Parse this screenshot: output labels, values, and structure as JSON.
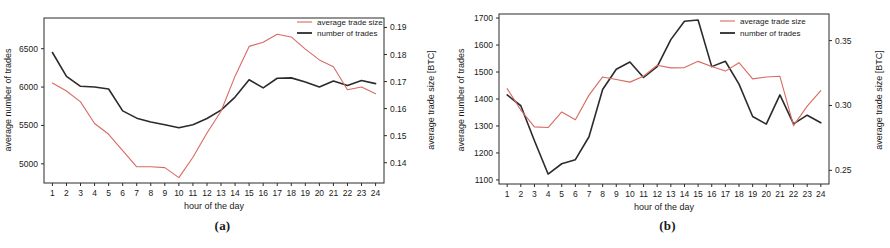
{
  "figure": {
    "panels": [
      {
        "caption": "(a)",
        "xlabel": "hour of the day",
        "ylabel_left": "average number of trades",
        "ylabel_right": "average trade size [BTC]",
        "legend": [
          {
            "label": "average trade size",
            "color": "#d96a62"
          },
          {
            "label": "number of trades",
            "color": "#2b2b2b"
          }
        ]
      },
      {
        "caption": "(b)",
        "xlabel": "hour of the day",
        "ylabel_left": "average number of trades",
        "ylabel_right": "average trade size [BTC]",
        "legend": [
          {
            "label": "average trade size",
            "color": "#d96a62"
          },
          {
            "label": "number of trades",
            "color": "#2b2b2b"
          }
        ]
      }
    ]
  },
  "chart_data": [
    {
      "type": "line",
      "panel": "(a)",
      "title": "",
      "xlabel": "hour of the day",
      "ylabel": "average number of trades",
      "ylabel_right": "average trade size [BTC]",
      "x": [
        1,
        2,
        3,
        4,
        5,
        6,
        7,
        8,
        9,
        10,
        11,
        12,
        13,
        14,
        15,
        16,
        17,
        18,
        19,
        20,
        21,
        22,
        23,
        24
      ],
      "xticklabels": [
        "1",
        "2",
        "3",
        "4",
        "5",
        "6",
        "7",
        "8",
        "9",
        "10",
        "11",
        "12",
        "13",
        "14",
        "15",
        "16",
        "17",
        "18",
        "19",
        "20",
        "21",
        "22",
        "23",
        "24"
      ],
      "xlim": [
        0.4,
        24.6
      ],
      "ylim_left": [
        4750,
        6900
      ],
      "yticks_left": [
        5000,
        5500,
        6000,
        6500
      ],
      "yticklabels_left": [
        "5000",
        "5500",
        "6000",
        "6500"
      ],
      "ylim_right": [
        0.1325,
        0.1935
      ],
      "yticks_right": [
        0.14,
        0.15,
        0.16,
        0.17,
        0.18,
        0.19
      ],
      "yticklabels_right": [
        "0.14",
        "0.15",
        "0.16",
        "0.17",
        "0.18",
        "0.19"
      ],
      "grid": false,
      "legend_position": "top-right",
      "series": [
        {
          "name": "number of trades",
          "color": "#2b2b2b",
          "axis": "left",
          "values": [
            6450,
            6140,
            6010,
            6000,
            5975,
            5690,
            5595,
            5545,
            5510,
            5470,
            5510,
            5590,
            5700,
            5870,
            6095,
            5990,
            6115,
            6120,
            6065,
            6000,
            6080,
            6020,
            6085,
            6045
          ]
        },
        {
          "name": "average trade size",
          "color": "#d96a62",
          "axis": "right",
          "values": [
            0.1695,
            0.1665,
            0.1625,
            0.1545,
            0.1505,
            0.1445,
            0.1385,
            0.1385,
            0.1382,
            0.1345,
            0.142,
            0.151,
            0.159,
            0.172,
            0.183,
            0.1845,
            0.1875,
            0.1865,
            0.182,
            0.178,
            0.1755,
            0.167,
            0.168,
            0.1655
          ]
        }
      ]
    },
    {
      "type": "line",
      "panel": "(b)",
      "title": "",
      "xlabel": "hour of the day",
      "ylabel": "average number of trades",
      "ylabel_right": "average trade size [BTC]",
      "x": [
        1,
        2,
        3,
        4,
        5,
        6,
        7,
        8,
        9,
        10,
        11,
        12,
        13,
        14,
        15,
        16,
        17,
        18,
        19,
        20,
        21,
        22,
        23,
        24
      ],
      "xticklabels": [
        "1",
        "2",
        "3",
        "4",
        "5",
        "6",
        "7",
        "8",
        "9",
        "10",
        "11",
        "12",
        "13",
        "14",
        "15",
        "16",
        "17",
        "18",
        "19",
        "20",
        "21",
        "22",
        "23",
        "24"
      ],
      "xlim": [
        0.4,
        24.6
      ],
      "ylim_left": [
        1085,
        1715
      ],
      "yticks_left": [
        1100,
        1200,
        1300,
        1400,
        1500,
        1600,
        1700
      ],
      "yticklabels_left": [
        "1100",
        "1200",
        "1300",
        "1400",
        "1500",
        "1600",
        "1700"
      ],
      "ylim_right": [
        0.2395,
        0.3705
      ],
      "yticks_right": [
        0.25,
        0.3,
        0.35
      ],
      "yticklabels_right": [
        "0.25",
        "0.30",
        "0.35"
      ],
      "grid": false,
      "legend_position": "top-right",
      "series": [
        {
          "name": "number of trades",
          "color": "#2b2b2b",
          "axis": "left",
          "values": [
            1415,
            1375,
            1245,
            1122,
            1160,
            1175,
            1260,
            1435,
            1510,
            1537,
            1480,
            1520,
            1620,
            1688,
            1693,
            1520,
            1540,
            1455,
            1335,
            1307,
            1415,
            1308,
            1340,
            1312
          ]
        },
        {
          "name": "average trade size",
          "color": "#d96a62",
          "axis": "right",
          "values": [
            0.313,
            0.2965,
            0.2835,
            0.283,
            0.295,
            0.289,
            0.308,
            0.322,
            0.32,
            0.318,
            0.3225,
            0.331,
            0.329,
            0.3292,
            0.334,
            0.33,
            0.3265,
            0.333,
            0.3205,
            0.322,
            0.3225,
            0.2845,
            0.2995,
            0.3115
          ]
        }
      ]
    }
  ]
}
